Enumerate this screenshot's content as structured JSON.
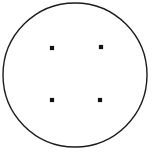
{
  "figure": {
    "background_color": "#ffffff",
    "canvas": {
      "width": 154,
      "height": 157
    },
    "caption": "",
    "circle": {
      "label": "outline-circle",
      "cx": 75,
      "cy": 75,
      "r": 72,
      "stroke_color": "#1c1c1c",
      "stroke_width": 1.4,
      "fill_color": "#ffffff"
    },
    "points": [
      {
        "label": "point-top-left",
        "cx": 52,
        "cy": 48,
        "size": 4.2,
        "color": "#121212"
      },
      {
        "label": "point-top-right",
        "cx": 101,
        "cy": 47,
        "size": 4.2,
        "color": "#121212"
      },
      {
        "label": "point-bottom-left",
        "cx": 52,
        "cy": 100,
        "size": 4.2,
        "color": "#121212"
      },
      {
        "label": "point-bottom-right",
        "cx": 100,
        "cy": 100,
        "size": 4.2,
        "color": "#121212"
      }
    ]
  },
  "chart_data": {
    "type": "scatter",
    "xlabel": "",
    "ylabel": "",
    "xlim": [
      0,
      154
    ],
    "ylim": [
      0,
      157
    ],
    "grid": false,
    "legend": "none",
    "series": [
      {
        "name": "points",
        "marker": "square",
        "color": "#121212",
        "x": [
          52,
          101,
          52,
          100
        ],
        "y": [
          48,
          47,
          100,
          100
        ]
      }
    ],
    "annotations": [
      {
        "type": "circle",
        "name": "outline-circle",
        "cx": 75,
        "cy": 75,
        "r": 72,
        "stroke": "#1c1c1c",
        "fill": "none"
      }
    ]
  }
}
